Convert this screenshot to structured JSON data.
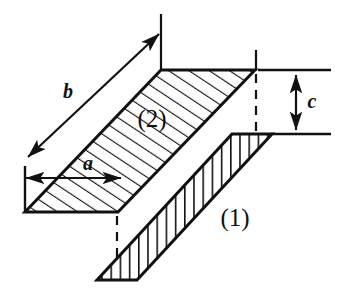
{
  "figure": {
    "kind": "engineering-isometric-diagram",
    "background_color": "#ffffff",
    "line_color": "#111111",
    "hatch_color": "#111111",
    "width": 341,
    "height": 299
  },
  "labels": {
    "dim_b": "b",
    "dim_a": "a",
    "dim_c": "c",
    "part_two": "(2)",
    "part_one": "(1)"
  },
  "dimensions": {
    "b": {
      "name": "b",
      "type": "double-arrow-oblique",
      "from": [
        27,
        158
      ],
      "to": [
        160,
        33
      ]
    },
    "a": {
      "name": "a",
      "type": "double-arrow-horizontal",
      "from": [
        25,
        178
      ],
      "to": [
        122,
        178
      ]
    },
    "c": {
      "name": "c",
      "type": "double-arrow-vertical",
      "from": [
        296,
        73
      ],
      "to": [
        296,
        133
      ]
    }
  },
  "shapes": {
    "part_two": {
      "name": "(2)",
      "outline": "161,70 255,70 118,212 25,212",
      "hatch": "parallel-oblique",
      "hatch_angle_deg": 57
    },
    "part_one": {
      "name": "(1)",
      "outline": "272,134 232,134 97,280 137,280",
      "hatch": "parallel-vertical",
      "hatch_angle_deg": 90
    }
  },
  "construction_lines": {
    "vertical_top_left": {
      "from": [
        161,
        14
      ],
      "to": [
        161,
        70
      ]
    },
    "vertical_top_right": {
      "from": [
        256,
        50
      ],
      "to": [
        256,
        70
      ]
    },
    "dashed_right": {
      "from": [
        256,
        72
      ],
      "to": [
        256,
        134
      ]
    },
    "dashed_bottom_left": {
      "from": [
        117,
        214
      ],
      "to": [
        117,
        280
      ]
    },
    "extension_top": {
      "from": [
        258,
        70
      ],
      "to": [
        331,
        70
      ]
    },
    "extension_bottom": {
      "from": [
        272,
        134
      ],
      "to": [
        331,
        134
      ]
    },
    "extension_left_vertical": {
      "from": [
        25,
        168
      ],
      "to": [
        25,
        214
      ]
    },
    "tick_a_right": {
      "from": [
        122,
        166
      ],
      "to": [
        122,
        190
      ]
    }
  },
  "colors": {
    "ink": "#111111",
    "paper": "#ffffff"
  }
}
